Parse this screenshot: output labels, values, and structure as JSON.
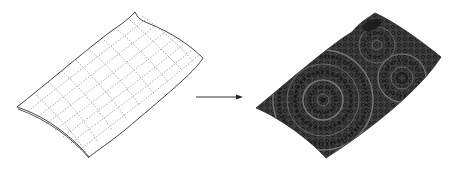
{
  "figure": {
    "left_panel": {
      "label": "wireframe-mesh",
      "stroke": "#555555",
      "fill": "#ffffff"
    },
    "arrow": {
      "label": "maps-to",
      "color": "#333333"
    },
    "right_panel": {
      "label": "textured-surface",
      "base_color": "#3a3a3a",
      "pattern_color": "#6e6e6e",
      "dark_color": "#1e1e1e"
    }
  }
}
